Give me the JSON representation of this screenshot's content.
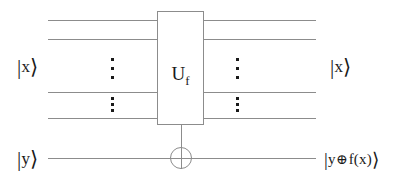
{
  "figure": {
    "type": "quantum-circuit-diagram",
    "line_color": "#8c8c8c",
    "text_color": "#1a1a1a",
    "background": "#ffffff"
  },
  "gate": {
    "label_main": "U",
    "label_sub": "f",
    "label_full": "U_f",
    "x": 157,
    "y": 11,
    "width": 47,
    "height": 114
  },
  "labels": {
    "input_register": "|x⟩",
    "input_register_parts": {
      "bar": "|",
      "symbol": "x",
      "angle": "⟩"
    },
    "output_register": "|x⟩",
    "output_register_parts": {
      "bar": "|",
      "symbol": "x",
      "angle": "⟩"
    },
    "input_ancilla": "|y⟩",
    "input_ancilla_parts": {
      "bar": "|",
      "symbol": "y",
      "angle": "⟩"
    },
    "output_ancilla": "|y⊕f(x)⟩",
    "output_ancilla_parts": {
      "bar": "|",
      "symbol_left": "y",
      "operator": "⊕",
      "symbol_right": "f(x)",
      "angle": "⟩"
    }
  },
  "wires": [
    {
      "name": "x-wire-1-left",
      "x": 48,
      "y": 20,
      "length": 109
    },
    {
      "name": "x-wire-1-right",
      "x": 204,
      "y": 20,
      "length": 112
    },
    {
      "name": "x-wire-2-left",
      "x": 48,
      "y": 39,
      "length": 109
    },
    {
      "name": "x-wire-2-right",
      "x": 204,
      "y": 39,
      "length": 112
    },
    {
      "name": "x-wire-3-left",
      "x": 48,
      "y": 92,
      "length": 109
    },
    {
      "name": "x-wire-3-right",
      "x": 204,
      "y": 92,
      "length": 112
    },
    {
      "name": "x-wire-4-left",
      "x": 48,
      "y": 118,
      "length": 109
    },
    {
      "name": "x-wire-4-right",
      "x": 204,
      "y": 118,
      "length": 112
    },
    {
      "name": "y-wire-left",
      "x": 48,
      "y": 158,
      "length": 122
    },
    {
      "name": "y-wire-right",
      "x": 192,
      "y": 158,
      "length": 124
    }
  ],
  "ellipses": [
    {
      "name": "dots-left-upper",
      "x": 112,
      "y": 58,
      "height": 20,
      "count": 3
    },
    {
      "name": "dots-left-lower",
      "x": 112,
      "y": 97,
      "height": 14,
      "count": 3
    },
    {
      "name": "dots-right-upper",
      "x": 237,
      "y": 58,
      "height": 20,
      "count": 3
    },
    {
      "name": "dots-right-lower",
      "x": 237,
      "y": 97,
      "height": 14,
      "count": 3
    }
  ],
  "cnot": {
    "name": "cnot-target",
    "center_x": 181,
    "center_y": 158,
    "radius": 11,
    "control_line_from_y": 125,
    "control_line_to_y": 147
  },
  "positions": {
    "ket_x_in": {
      "x": 17,
      "y": 57
    },
    "ket_x_out": {
      "x": 330,
      "y": 57
    },
    "ket_y_in": {
      "x": 17,
      "y": 149
    },
    "ket_y_out": {
      "x": 324,
      "y": 150
    }
  }
}
